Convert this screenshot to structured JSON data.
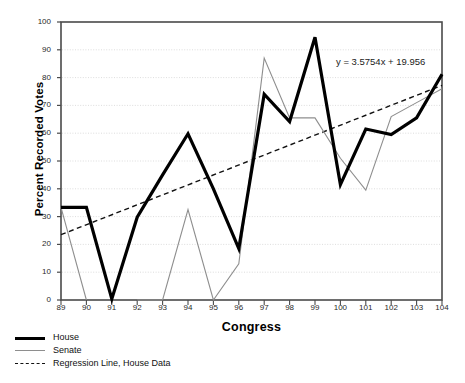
{
  "chart_data": {
    "type": "line",
    "title": "",
    "xlabel": "Congress",
    "ylabel": "Percent Recorded Votes",
    "xlim": [
      89,
      104
    ],
    "ylim": [
      0,
      100
    ],
    "ytick_step": 10,
    "grid": true,
    "legend_position": "below-left",
    "x": [
      89,
      90,
      91,
      92,
      93,
      94,
      95,
      96,
      97,
      98,
      99,
      100,
      101,
      102,
      103,
      104
    ],
    "categories": [
      "89",
      "90",
      "91",
      "92",
      "93",
      "94",
      "95",
      "96",
      "97",
      "98",
      "99",
      "100",
      "101",
      "102",
      "103",
      "104"
    ],
    "ytick_labels": [
      "0",
      "10",
      "20",
      "30",
      "40",
      "50",
      "60",
      "70",
      "80",
      "90",
      "100"
    ],
    "series": [
      {
        "name": "House",
        "color": "#000000",
        "width": 3.2,
        "style": "solid",
        "values": [
          33.3,
          33.3,
          0.4,
          29.8,
          45.0,
          59.8,
          40.0,
          18.5,
          74.0,
          64.2,
          94.5,
          41.5,
          61.5,
          59.5,
          65.5,
          81.2
        ]
      },
      {
        "name": "Senate",
        "color": "#8e8e8e",
        "width": 1.1,
        "style": "solid",
        "values": [
          33.3,
          0.0,
          null,
          0.0,
          0.0,
          32.5,
          0.0,
          13.0,
          87.0,
          65.5,
          65.5,
          51.0,
          39.5,
          66.0,
          71.0,
          76.0
        ]
      }
    ],
    "regression": {
      "name": "Regression Line, House Data",
      "color": "#111111",
      "style": "dashed",
      "slope": 3.5754,
      "intercept": 19.956,
      "equation": "y = 3.5754x + 19.956",
      "x_index_start": 1,
      "y_start": 23.5,
      "y_end": 77.2
    }
  },
  "legend": {
    "items": [
      {
        "label": "House",
        "swatch": "thick-black-line"
      },
      {
        "label": "Senate",
        "swatch": "thin-gray-line"
      },
      {
        "label": "Regression Line, House Data",
        "swatch": "dashed-black-line"
      }
    ]
  },
  "colors": {
    "house": "#000000",
    "senate": "#8e8e8e",
    "regression": "#111111",
    "grid": "#d9d9d9",
    "axis": "#4a4a4a",
    "background": "#ffffff"
  }
}
